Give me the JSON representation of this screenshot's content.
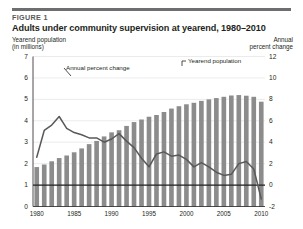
{
  "figure": {
    "label": "FIGURE 1",
    "title": "Adults under community supervision at yearend, 1980–2010",
    "left_axis_caption_line1": "Yearend population",
    "left_axis_caption_line2": "(in millions)",
    "right_axis_caption_line1": "Annual",
    "right_axis_caption_line2": "percent change"
  },
  "annotations": {
    "percent_change_label": "Annual percent change",
    "population_label": "Yearend population"
  },
  "colors": {
    "bar": "#8c8c8c",
    "line": "#595959",
    "grid": "#e2e2e2",
    "axis": "#231f20",
    "rule": "#6d6e71",
    "fig_label": "#58595b",
    "background": "#ffffff"
  },
  "chart_data": {
    "type": "bar",
    "title": "Adults under community supervision at yearend, 1980–2010",
    "xlabel": "",
    "ylabel": "Yearend population (in millions)",
    "y2label": "Annual percent change",
    "ylim": [
      0,
      7
    ],
    "y2lim": [
      -2,
      12
    ],
    "yticks": [
      0,
      1,
      2,
      3,
      4,
      5,
      6,
      7
    ],
    "y2ticks": [
      -2,
      0,
      2,
      4,
      6,
      8,
      10,
      12
    ],
    "xticks": [
      "1980",
      "1985",
      "1990",
      "1995",
      "2000",
      "2005",
      "2010"
    ],
    "grid": true,
    "legend": "annotated-inline",
    "reference_line": {
      "left_axis_value": 1.0,
      "right_axis_value": 0
    },
    "categories": [
      "1980",
      "1981",
      "1982",
      "1983",
      "1984",
      "1985",
      "1986",
      "1987",
      "1988",
      "1989",
      "1990",
      "1991",
      "1992",
      "1993",
      "1994",
      "1995",
      "1996",
      "1997",
      "1998",
      "1999",
      "2000",
      "2001",
      "2002",
      "2003",
      "2004",
      "2005",
      "2006",
      "2007",
      "2008",
      "2009",
      "2010"
    ],
    "series": [
      {
        "name": "Yearend population",
        "type": "bar",
        "axis": "left",
        "unit": "millions",
        "values": [
          1.84,
          1.96,
          2.11,
          2.26,
          2.38,
          2.53,
          2.71,
          2.91,
          3.06,
          3.27,
          3.46,
          3.56,
          3.76,
          3.94,
          4.06,
          4.19,
          4.27,
          4.41,
          4.57,
          4.68,
          4.77,
          4.84,
          4.93,
          5.0,
          5.06,
          5.12,
          5.18,
          5.2,
          5.17,
          5.12,
          4.89
        ]
      },
      {
        "name": "Annual percent change",
        "type": "line",
        "axis": "right",
        "unit": "percent",
        "values": [
          2.6,
          5.1,
          5.6,
          6.4,
          5.3,
          4.9,
          4.7,
          4.4,
          4.4,
          4.0,
          4.3,
          4.8,
          4.1,
          3.5,
          2.5,
          1.7,
          2.9,
          3.1,
          2.7,
          2.8,
          2.4,
          1.7,
          2.1,
          1.7,
          1.2,
          0.9,
          1.0,
          2.0,
          2.2,
          1.5,
          -1.3
        ]
      }
    ]
  }
}
